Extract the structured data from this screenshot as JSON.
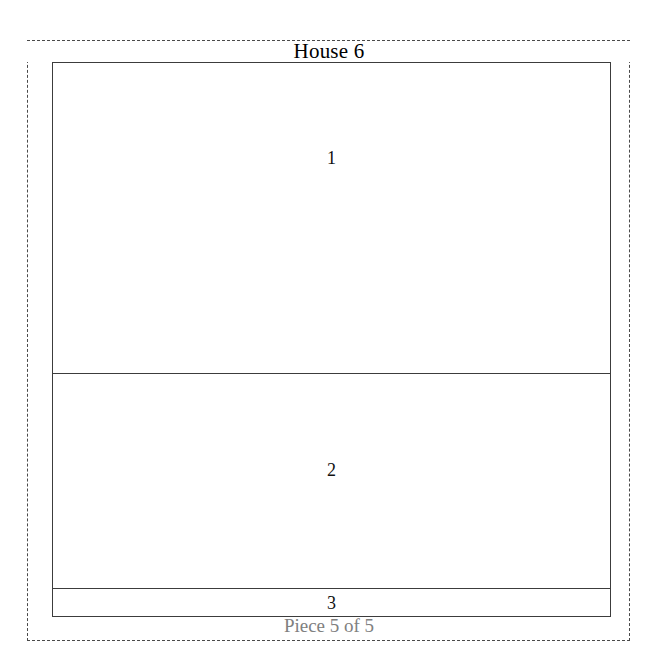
{
  "figure": {
    "title": "House 6",
    "caption": "Piece 5 of 5",
    "colors": {
      "outline": "#3c3c3c",
      "boundary_dashed": "#4a4a4a",
      "label_text": "#111111",
      "caption_text": "#808080",
      "background": "#ffffff"
    }
  },
  "floorplan": {
    "rooms": [
      {
        "id": "room-1",
        "label": "1"
      },
      {
        "id": "room-2",
        "label": "2"
      },
      {
        "id": "room-3",
        "label": "3"
      }
    ]
  }
}
